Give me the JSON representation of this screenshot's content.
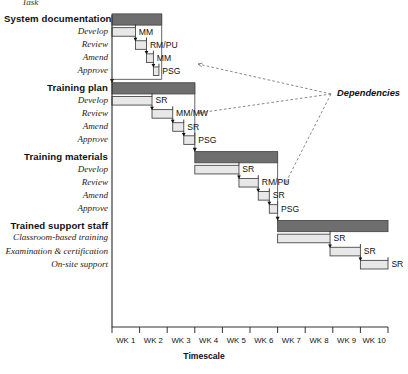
{
  "chart_data": {
    "type": "bar",
    "subtype": "gantt",
    "title": "",
    "xlabel": "Timescale",
    "ylabel": "",
    "xlim": [
      0,
      10
    ],
    "grid": false,
    "x_tick_labels": [
      "WK 1",
      "WK 2",
      "WK 3",
      "WK 4",
      "WK 5",
      "WK 6",
      "WK 7",
      "WK 8",
      "WK 9",
      "WK 10"
    ],
    "top_note": "Task",
    "annotations": [
      {
        "text": "Dependencies",
        "x": 10.6,
        "y": 94
      }
    ],
    "legend": [],
    "groups": [
      {
        "name": "System documentation",
        "summary": {
          "start": 0.0,
          "end": 1.8
        },
        "tasks": [
          {
            "label": "Develop",
            "start": 0.0,
            "end": 0.85,
            "resource": "MM"
          },
          {
            "label": "Review",
            "start": 0.85,
            "end": 1.25,
            "resource": "RM/PU"
          },
          {
            "label": "Amend",
            "start": 1.25,
            "end": 1.5,
            "resource": "MM"
          },
          {
            "label": "Approve",
            "start": 1.5,
            "end": 1.7,
            "resource": "PSG"
          }
        ]
      },
      {
        "name": "Training plan",
        "summary": {
          "start": 0.0,
          "end": 3.0
        },
        "tasks": [
          {
            "label": "Develop",
            "start": 0.0,
            "end": 1.45,
            "resource": "SR"
          },
          {
            "label": "Review",
            "start": 1.45,
            "end": 2.2,
            "resource": "MM/MW"
          },
          {
            "label": "Amend",
            "start": 2.2,
            "end": 2.6,
            "resource": "SR"
          },
          {
            "label": "Approve",
            "start": 2.6,
            "end": 3.0,
            "resource": "PSG"
          }
        ]
      },
      {
        "name": "Training materials",
        "summary": {
          "start": 3.0,
          "end": 6.0
        },
        "tasks": [
          {
            "label": "Develop",
            "start": 3.0,
            "end": 4.6,
            "resource": "SR"
          },
          {
            "label": "Review",
            "start": 4.6,
            "end": 5.3,
            "resource": "RM/PU"
          },
          {
            "label": "Amend",
            "start": 5.3,
            "end": 5.7,
            "resource": "SR"
          },
          {
            "label": "Approve",
            "start": 5.7,
            "end": 6.0,
            "resource": "PSG"
          }
        ]
      },
      {
        "name": "Trained support staff",
        "summary": {
          "start": 6.0,
          "end": 10.0
        },
        "tasks": [
          {
            "label": "Classroom-based training",
            "start": 6.0,
            "end": 7.9,
            "resource": "SR"
          },
          {
            "label": "Examination & certification",
            "start": 7.9,
            "end": 9.0,
            "resource": "SR"
          },
          {
            "label": "On-site support",
            "start": 9.0,
            "end": 10.0,
            "resource": "SR"
          }
        ]
      }
    ],
    "colors": {
      "summary_bar": "#6e6e6e",
      "task_bar": "#e8e8e8",
      "bar_stroke": "#4a4a4a",
      "axis": "#333333",
      "dependency_line": "#7a7a7a",
      "background": "#ffffff"
    }
  }
}
